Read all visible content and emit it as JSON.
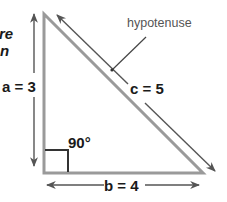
{
  "diagram": {
    "title_fragment": {
      "lines": [
        "re",
        "n"
      ]
    },
    "triangle": {
      "vertices": {
        "top": [
          44,
          14
        ],
        "bottom_left": [
          44,
          173
        ],
        "bottom_right": [
          203,
          173
        ]
      },
      "stroke_color": "#9a9a9a"
    },
    "sides": {
      "a": {
        "label": "a = 3",
        "name": "a",
        "value": 3
      },
      "b": {
        "label": "b = 4",
        "name": "b",
        "value": 4
      },
      "c": {
        "label": "c = 5",
        "name": "c",
        "value": 5
      }
    },
    "hypotenuse_label": "hypotenuse",
    "right_angle_label": "90°",
    "colors": {
      "triangle": "#9a9a9a",
      "arrows": "#555555",
      "text": "#1a1a1a",
      "annotation": "#555555"
    }
  }
}
